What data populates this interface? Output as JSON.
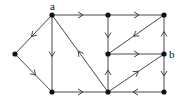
{
  "diagram": {
    "type": "directed-graph",
    "colors": {
      "edge": "#333333",
      "node": "#111111",
      "background": "#ffffff"
    },
    "nodes": [
      {
        "id": "a",
        "label": "a",
        "x": 52,
        "y": 15,
        "label_dx": -2,
        "label_dy": -5
      },
      {
        "id": "left",
        "label": "",
        "x": 15,
        "y": 54
      },
      {
        "id": "bl",
        "label": "",
        "x": 52,
        "y": 92
      },
      {
        "id": "tm",
        "label": "",
        "x": 108,
        "y": 15
      },
      {
        "id": "tr",
        "label": "",
        "x": 164,
        "y": 15
      },
      {
        "id": "mm",
        "label": "",
        "x": 108,
        "y": 54
      },
      {
        "id": "b",
        "label": "b",
        "x": 164,
        "y": 54,
        "label_dx": 5,
        "label_dy": 4
      },
      {
        "id": "bm",
        "label": "",
        "x": 108,
        "y": 92
      },
      {
        "id": "br",
        "label": "",
        "x": 164,
        "y": 92
      }
    ],
    "edges": [
      {
        "from": "a",
        "to": "left"
      },
      {
        "from": "left",
        "to": "bl"
      },
      {
        "from": "a",
        "to": "bl"
      },
      {
        "from": "a",
        "to": "tm"
      },
      {
        "from": "bm",
        "to": "a"
      },
      {
        "from": "bl",
        "to": "bm"
      },
      {
        "from": "tm",
        "to": "tr"
      },
      {
        "from": "tm",
        "to": "mm"
      },
      {
        "from": "tr",
        "to": "mm"
      },
      {
        "from": "mm",
        "to": "b"
      },
      {
        "from": "bm",
        "to": "mm"
      },
      {
        "from": "bm",
        "to": "b"
      },
      {
        "from": "b",
        "to": "tr"
      },
      {
        "from": "b",
        "to": "br"
      },
      {
        "from": "br",
        "to": "bm"
      }
    ]
  }
}
